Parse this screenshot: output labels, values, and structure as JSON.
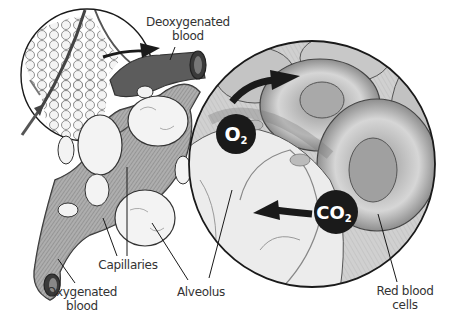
{
  "labels": {
    "deoxygenated": {
      "line1": "Deoxygenated",
      "line2": "blood"
    },
    "oxygenated": {
      "line1": "Oxygenated",
      "line2": "blood"
    },
    "capillaries": "Capillaries",
    "alveolus": "Alveolus",
    "red_blood_cells": {
      "line1": "Red blood",
      "line2": "cells"
    }
  },
  "badges": {
    "o2": {
      "main": "O",
      "sub": "2"
    },
    "co2": {
      "main": "CO",
      "sub": "2"
    }
  },
  "colors": {
    "ink": "#1a1a1a",
    "vessel": "#4a4a4a",
    "vessel_light": "#8a8a8a",
    "cell": "#bcbcbc",
    "cell_light": "#e4e4e4",
    "alveolus_fill": "#f3f3f3",
    "label": "#333333"
  }
}
